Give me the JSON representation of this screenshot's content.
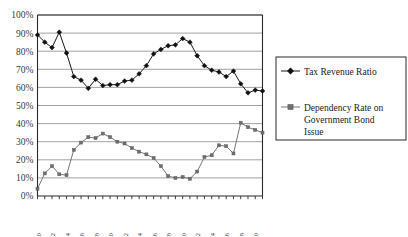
{
  "chart_data": {
    "type": "line",
    "title": "",
    "xlabel": "",
    "ylabel": "",
    "ylim": [
      0,
      100
    ],
    "xlim": [
      1970,
      2001
    ],
    "grid": true,
    "legend_position": "right",
    "y_unit": "%",
    "ytick_labels": [
      "100%",
      "90%",
      "80%",
      "70%",
      "60%",
      "50%",
      "40%",
      "30%",
      "20%",
      "10%",
      "0%"
    ],
    "ytick_values": [
      100,
      90,
      80,
      70,
      60,
      50,
      40,
      30,
      20,
      10,
      0
    ],
    "x": [
      1970,
      1971,
      1972,
      1973,
      1974,
      1975,
      1976,
      1977,
      1978,
      1979,
      1980,
      1981,
      1982,
      1983,
      1984,
      1985,
      1986,
      1987,
      1988,
      1989,
      1990,
      1991,
      1992,
      1993,
      1994,
      1995,
      1996,
      1997,
      1998,
      1999,
      2000,
      2001
    ],
    "xtick_labels": [
      "1970",
      "1972",
      "1974",
      "1976",
      "1978",
      "1980",
      "1982",
      "1984",
      "1986",
      "1988",
      "1990",
      "1992",
      "1994",
      "1996",
      "1998",
      "2000"
    ],
    "xtick_values": [
      1970,
      1972,
      1974,
      1976,
      1978,
      1980,
      1982,
      1984,
      1986,
      1988,
      1990,
      1992,
      1994,
      1996,
      1998,
      2000
    ],
    "series": [
      {
        "name": "Tax Revenue Ratio",
        "marker": "diamond",
        "color": "#111111",
        "values": [
          89.0,
          85.0,
          82.0,
          90.5,
          79.0,
          66.0,
          64.0,
          59.5,
          64.5,
          61.0,
          61.5,
          61.5,
          63.5,
          64.0,
          67.5,
          72.0,
          78.5,
          81.0,
          83.0,
          83.5,
          87.0,
          85.0,
          77.5,
          72.0,
          69.5,
          68.5,
          66.0,
          69.0,
          62.0,
          57.0,
          58.5,
          58.0
        ]
      },
      {
        "name": "Dependency Rate on Government Bond Issue",
        "marker": "square",
        "color": "#6f6f6f",
        "values": [
          4.0,
          12.5,
          16.5,
          12.0,
          11.5,
          25.5,
          29.5,
          32.5,
          32.0,
          34.5,
          32.5,
          30.0,
          29.0,
          26.5,
          24.5,
          23.0,
          21.0,
          16.5,
          11.0,
          10.0,
          10.5,
          9.5,
          13.5,
          21.5,
          22.5,
          28.0,
          27.5,
          23.5,
          40.5,
          38.0,
          36.5,
          35.0
        ]
      }
    ]
  },
  "legend": {
    "items": [
      {
        "label": "Tax Revenue Ratio",
        "marker": "diamond-marker-icon"
      },
      {
        "label": "Dependency Rate on Government Bond Issue",
        "marker": "square-marker-icon"
      }
    ],
    "item2_line1": "Dependency Rate on",
    "item2_line2": "Government Bond",
    "item2_line3": "Issue"
  }
}
